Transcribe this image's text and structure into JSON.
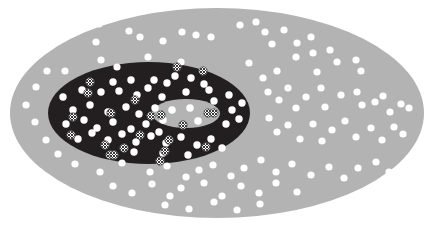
{
  "figure": {
    "width": 434,
    "height": 226,
    "background_color": "#ffffff"
  },
  "colors": {
    "background": "#ffffff",
    "outer_zone": "#b3b3b3",
    "middle_zone": "#231f20",
    "inner_zone": "#b3b3b3",
    "dot_plain_fill": "#ffffff",
    "dot_hatched_fill": "#ffffff",
    "dot_hatched_pattern": "#3a3a3a",
    "dot_hatched_stroke": "#5a5a5a"
  },
  "zones": [
    {
      "name": "outer-zone",
      "label": "outer ellipse",
      "shape": "ellipse",
      "cx": 217,
      "cy": 113,
      "rx": 207,
      "ry": 105,
      "fill": "#b3b3b3"
    },
    {
      "name": "middle-zone",
      "label": "middle dark ellipse",
      "shape": "ellipse",
      "cx": 149,
      "cy": 113,
      "rx": 101,
      "ry": 51,
      "fill": "#231f20"
    },
    {
      "name": "inner-zone",
      "label": "inner ellipse",
      "shape": "ellipse",
      "cx": 186,
      "cy": 113.5,
      "rx": 34,
      "ry": 14.5,
      "fill": "#b3b3b3"
    }
  ],
  "legend": {
    "marker_types": [
      {
        "key": "plain",
        "label": "plain white dot",
        "radius": 3.6
      },
      {
        "key": "hatched",
        "label": "cross-hatched dot",
        "radius": 4.2
      }
    ]
  },
  "counts": {
    "plain_dots_outer": 98,
    "plain_dots_middle": 46,
    "plain_dots_inner": 4,
    "hatched_dots_middle": 18,
    "hatched_dots_inner": 4
  },
  "chart_data": {
    "type": "scatter",
    "xlabel": "",
    "ylabel": "",
    "xlim": [
      0,
      434
    ],
    "ylim": [
      0,
      226
    ],
    "grid": false,
    "legend": "none",
    "series": [
      {
        "name": "plain-dots",
        "marker": "plain",
        "radius": 3.6,
        "fill": "#ffffff",
        "points": [
          [
            99,
            24
          ],
          [
            129,
            31
          ],
          [
            182,
            32
          ],
          [
            240,
            25
          ],
          [
            256,
            22
          ],
          [
            265,
            32
          ],
          [
            284,
            30
          ],
          [
            96,
            42
          ],
          [
            140,
            37
          ],
          [
            163,
            41
          ],
          [
            196,
            35
          ],
          [
            211,
            37
          ],
          [
            272,
            44
          ],
          [
            297,
            43
          ],
          [
            311,
            37
          ],
          [
            313,
            53
          ],
          [
            330,
            50
          ],
          [
            47,
            71
          ],
          [
            65,
            71
          ],
          [
            101,
            60
          ],
          [
            117,
            67
          ],
          [
            148,
            57
          ],
          [
            181,
            62
          ],
          [
            249,
            63
          ],
          [
            263,
            78
          ],
          [
            277,
            71
          ],
          [
            296,
            57
          ],
          [
            317,
            72
          ],
          [
            337,
            62
          ],
          [
            356,
            60
          ],
          [
            361,
            71
          ],
          [
            26,
            105
          ],
          [
            36,
            87
          ],
          [
            35,
            122
          ],
          [
            46,
            140
          ],
          [
            58,
            154
          ],
          [
            75,
            164
          ],
          [
            100,
            172
          ],
          [
            268,
            92
          ],
          [
            279,
            100
          ],
          [
            288,
            88
          ],
          [
            296,
            108
          ],
          [
            306,
            97
          ],
          [
            321,
            88
          ],
          [
            325,
            107
          ],
          [
            341,
            95
          ],
          [
            357,
            92
          ],
          [
            362,
            105
          ],
          [
            375,
            102
          ],
          [
            383,
            96
          ],
          [
            390,
            112
          ],
          [
            401,
            104
          ],
          [
            409,
            108
          ],
          [
            269,
            118
          ],
          [
            277,
            132
          ],
          [
            288,
            125
          ],
          [
            300,
            139
          ],
          [
            313,
            124
          ],
          [
            322,
            141
          ],
          [
            332,
            130
          ],
          [
            345,
            121
          ],
          [
            356,
            137
          ],
          [
            371,
            128
          ],
          [
            382,
            140
          ],
          [
            394,
            127
          ],
          [
            403,
            134
          ],
          [
            122,
            163
          ],
          [
            150,
            172
          ],
          [
            167,
            166
          ],
          [
            186,
            177
          ],
          [
            199,
            170
          ],
          [
            213,
            165
          ],
          [
            231,
            176
          ],
          [
            244,
            168
          ],
          [
            261,
            160
          ],
          [
            276,
            172
          ],
          [
            292,
            164
          ],
          [
            311,
            175
          ],
          [
            329,
            167
          ],
          [
            344,
            178
          ],
          [
            358,
            168
          ],
          [
            376,
            162
          ],
          [
            389,
            172
          ],
          [
            113,
            186
          ],
          [
            132,
            193
          ],
          [
            152,
            184
          ],
          [
            170,
            196
          ],
          [
            181,
            188
          ],
          [
            204,
            183
          ],
          [
            222,
            196
          ],
          [
            241,
            186
          ],
          [
            259,
            193
          ],
          [
            276,
            183
          ],
          [
            297,
            192
          ],
          [
            165,
            205
          ],
          [
            189,
            209
          ],
          [
            214,
            202
          ],
          [
            237,
            210
          ],
          [
            260,
            204
          ]
        ]
      },
      {
        "name": "plain-dots-middle-zone",
        "marker": "plain",
        "radius": 3.7,
        "fill": "#ffffff",
        "points": [
          [
            113,
            82
          ],
          [
            131,
            80
          ],
          [
            154,
            80
          ],
          [
            167,
            83
          ],
          [
            175,
            76
          ],
          [
            191,
            78
          ],
          [
            204,
            84
          ],
          [
            63,
            97
          ],
          [
            82,
            90
          ],
          [
            101,
            92
          ],
          [
            119,
            91
          ],
          [
            137,
            95
          ],
          [
            148,
            88
          ],
          [
            162,
            97
          ],
          [
            186,
            92
          ],
          [
            209,
            90
          ],
          [
            214,
            101
          ],
          [
            229,
            95
          ],
          [
            73,
            110
          ],
          [
            90,
            105
          ],
          [
            108,
            112
          ],
          [
            126,
            107
          ],
          [
            139,
            114
          ],
          [
            155,
            108
          ],
          [
            232,
            110
          ],
          [
            242,
            103
          ],
          [
            66,
            124
          ],
          [
            84,
            120
          ],
          [
            97,
            128
          ],
          [
            113,
            122
          ],
          [
            131,
            129
          ],
          [
            146,
            124
          ],
          [
            159,
            132
          ],
          [
            226,
            124
          ],
          [
            239,
            119
          ],
          [
            78,
            139
          ],
          [
            92,
            133
          ],
          [
            108,
            140
          ],
          [
            122,
            134
          ],
          [
            136,
            142
          ],
          [
            151,
            136
          ],
          [
            166,
            143
          ],
          [
            181,
            137
          ],
          [
            197,
            145
          ],
          [
            211,
            139
          ],
          [
            222,
            148
          ],
          [
            134,
            152
          ],
          [
            163,
            153
          ],
          [
            188,
            155
          ]
        ]
      },
      {
        "name": "plain-dots-inner-zone",
        "marker": "plain",
        "radius": 3.8,
        "fill": "#ffffff",
        "points": [
          [
            172,
            110
          ],
          [
            190,
            108
          ],
          [
            163,
            120
          ],
          [
            198,
            121
          ]
        ]
      },
      {
        "name": "hatched-dots",
        "marker": "hatched",
        "radius": 4.2,
        "fill": "#ffffff",
        "pattern": "#3a3a3a",
        "points": [
          [
            90,
            82
          ],
          [
            177,
            67
          ],
          [
            88,
            93
          ],
          [
            203,
            71
          ],
          [
            73,
            117
          ],
          [
            111,
            113
          ],
          [
            71,
            135
          ],
          [
            105,
            145
          ],
          [
            110,
            155
          ],
          [
            151,
            116
          ],
          [
            140,
            135
          ],
          [
            114,
            155
          ],
          [
            124,
            148
          ],
          [
            135,
            100
          ],
          [
            169,
            140
          ],
          [
            160,
            161
          ],
          [
            165,
            151
          ],
          [
            206,
            147
          ]
        ]
      },
      {
        "name": "hatched-dots-inner-zone",
        "marker": "hatched",
        "radius": 4.2,
        "fill": "#ffffff",
        "pattern": "#3a3a3a",
        "points": [
          [
            161,
            115
          ],
          [
            183,
            125
          ],
          [
            208,
            113
          ],
          [
            214,
            113
          ]
        ]
      }
    ]
  }
}
